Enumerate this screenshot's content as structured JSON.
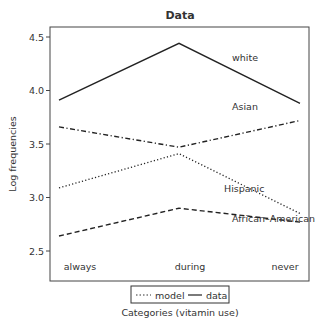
{
  "chart_data": {
    "type": "line",
    "title": "Data",
    "xlabel": "Categories (vitamin use)",
    "ylabel": "Log frequencies",
    "categories": [
      "always",
      "during",
      "never"
    ],
    "yticks": [
      2.5,
      3.0,
      3.5,
      4.0,
      4.5
    ],
    "ylim": [
      2.36,
      4.6
    ],
    "grid": false,
    "legend": {
      "position": "bottom-center",
      "entries": [
        {
          "label": "model",
          "style": "dotted"
        },
        {
          "label": "data",
          "style": "solid"
        }
      ]
    },
    "series": [
      {
        "name": "white",
        "style": "solid",
        "values": [
          3.91,
          4.44,
          3.88
        ],
        "label_pos": [
          3,
          4.25
        ]
      },
      {
        "name": "Asian",
        "style": "dashdot",
        "values": [
          3.66,
          3.47,
          3.72
        ],
        "label_pos": [
          3,
          3.93
        ]
      },
      {
        "name": "Hispanic",
        "style": "dotted",
        "values": [
          3.09,
          3.41,
          2.85
        ],
        "label_pos": [
          3,
          3.19
        ]
      },
      {
        "name": "African–American",
        "style": "dashed",
        "values": [
          2.64,
          2.9,
          2.77
        ],
        "label_pos": [
          3,
          2.95
        ]
      }
    ]
  }
}
